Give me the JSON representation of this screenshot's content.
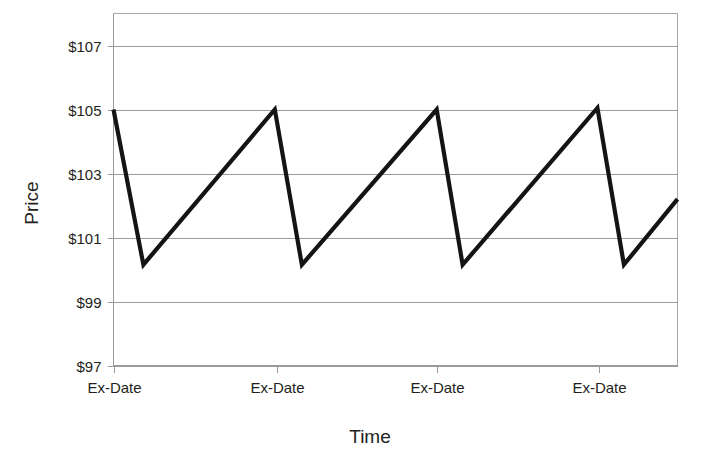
{
  "chart_data": {
    "type": "line",
    "title": "",
    "xlabel": "Time",
    "ylabel": "Price",
    "grid": true,
    "legend": false,
    "ylim": [
      97,
      108
    ],
    "yticks": [
      97,
      99,
      101,
      103,
      105,
      107
    ],
    "ytick_labels": [
      "$97",
      "$99",
      "$101",
      "$103",
      "$105",
      "$107"
    ],
    "xtick_labels": [
      "Ex-Date",
      "Ex-Date",
      "Ex-Date",
      "Ex-Date"
    ],
    "xtick_positions": [
      0.0,
      0.29,
      0.573,
      0.861
    ],
    "series": [
      {
        "name": "Price",
        "color": "#141414",
        "points": [
          {
            "x": 0.0,
            "y": 105.0
          },
          {
            "x": 0.053,
            "y": 100.15
          },
          {
            "x": 0.286,
            "y": 105.0
          },
          {
            "x": 0.334,
            "y": 100.15
          },
          {
            "x": 0.573,
            "y": 105.0
          },
          {
            "x": 0.619,
            "y": 100.15
          },
          {
            "x": 0.858,
            "y": 105.05
          },
          {
            "x": 0.905,
            "y": 100.15
          },
          {
            "x": 1.0,
            "y": 102.2
          }
        ]
      }
    ],
    "annotation": "Sawtooth price pattern: price rises steadily then drops by the dividend amount on each Ex-Date."
  },
  "axis_titles": {
    "y": "Price",
    "x": "Time"
  },
  "colors": {
    "line": "#141414",
    "grid": "#9a9a9a",
    "border": "#a8a8a8",
    "text": "#231f20",
    "background": "#ffffff"
  }
}
